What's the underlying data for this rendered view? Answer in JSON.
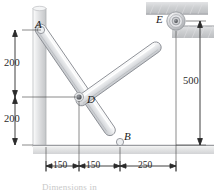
{
  "figure": {
    "type": "engineering-mechanism-diagram",
    "width": 214,
    "height": 190,
    "background": "#ffffff"
  },
  "points": [
    {
      "id": "A",
      "label": "A",
      "x": 41,
      "y": 30,
      "desc": "pin at top of vertical wall"
    },
    {
      "id": "D",
      "label": "D",
      "x": 82,
      "y": 100,
      "desc": "pin joint where links cross"
    },
    {
      "id": "B",
      "label": "B",
      "x": 120,
      "y": 138,
      "desc": "lower end of link AB on ground"
    },
    {
      "id": "E",
      "label": "E",
      "x": 163,
      "y": 20,
      "desc": "bearing / pulley at upper right support"
    }
  ],
  "members": [
    {
      "id": "AB",
      "from": "A",
      "to": "B",
      "desc": "long slotted link from wall down to ground"
    },
    {
      "id": "DE",
      "from": "D",
      "to": "E",
      "desc": "link from mid pin up to bearing at E"
    }
  ],
  "supports": [
    {
      "id": "left-wall",
      "desc": "vertical shaded wall on left"
    },
    {
      "id": "ground",
      "desc": "horizontal shaded floor at bottom"
    },
    {
      "id": "top-block",
      "desc": "hatched support block above E"
    },
    {
      "id": "right-block",
      "desc": "hatched support block right of E"
    }
  ],
  "dimensions": {
    "vertical_left": [
      {
        "value": "200",
        "desc": "from A down to D level"
      },
      {
        "value": "200",
        "desc": "from D level down to ground"
      }
    ],
    "vertical_right": [
      {
        "value": "500",
        "desc": "from E level down to ground"
      }
    ],
    "horizontal_bottom": [
      {
        "value": "150",
        "desc": "wall to D vertical"
      },
      {
        "value": "150",
        "desc": "D vertical to B"
      },
      {
        "value": "250",
        "desc": "B to E vertical"
      }
    ]
  },
  "colors": {
    "link_fill": "#e9eaec",
    "link_stroke": "#8d9096",
    "wall_fill": "#d8d9db",
    "ground_fill": "#d8d9db",
    "block_fill": "#c9cbcd",
    "pin": "#5a5c60",
    "dimension_line": "#2b2b2b",
    "text": "#1a1a1a"
  },
  "caption": {
    "text": "Dimensions in"
  }
}
